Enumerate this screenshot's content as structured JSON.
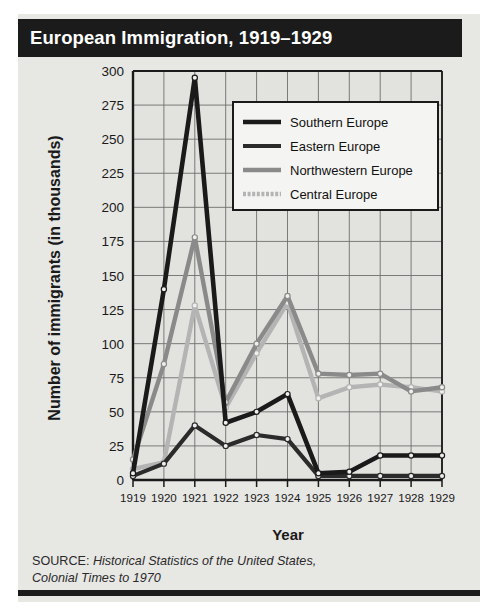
{
  "title": "European Immigration, 1919–1929",
  "axes": {
    "ylabel": "Number of immigrants (in thousands)",
    "xlabel": "Year"
  },
  "source": {
    "label": "SOURCE:",
    "text_line1": "Historical Statistics of the United States,",
    "text_line2": "Colonial Times to 1970"
  },
  "colors": {
    "title_bar": "#1b1b1b",
    "panel_bg": "#e7e7e4",
    "plot_bg": "#e2e2de",
    "grid": "#6e6e6e",
    "axis": "#1a1a1a",
    "southern_europe": "#1a1a1a",
    "eastern_europe": "#2b2b2b",
    "northwestern_europe": "#8a8a8a",
    "central_europe": "#b4b4b4",
    "legend_bg": "#f4f4f2"
  },
  "chart_data": {
    "type": "line",
    "title": "European Immigration, 1919–1929",
    "xlabel": "Year",
    "ylabel": "Number of immigrants (in thousands)",
    "categories": [
      "1919",
      "1920",
      "1921",
      "1922",
      "1923",
      "1924",
      "1925",
      "1926",
      "1927",
      "1928",
      "1929"
    ],
    "x": [
      1919,
      1920,
      1921,
      1922,
      1923,
      1924,
      1925,
      1926,
      1927,
      1928,
      1929
    ],
    "ylim": [
      0,
      300
    ],
    "yticks": [
      0,
      25,
      50,
      75,
      100,
      125,
      150,
      175,
      200,
      225,
      250,
      275,
      300
    ],
    "ytick_labels": [
      "0",
      "25",
      "50",
      "75",
      "100",
      "125",
      "150",
      "175",
      "200",
      "225",
      "250",
      "275",
      "300"
    ],
    "grid": true,
    "legend_position": "upper right",
    "markers": "open-circle",
    "series": [
      {
        "name": "Southern Europe",
        "color": "#1a1a1a",
        "width": 4.6,
        "dash": "none",
        "values": [
          5,
          140,
          295,
          42,
          50,
          63,
          5,
          6,
          18,
          18,
          18
        ]
      },
      {
        "name": "Eastern Europe",
        "color": "#2b2b2b",
        "width": 4.2,
        "dash": "none",
        "values": [
          3,
          12,
          40,
          25,
          33,
          30,
          3,
          3,
          3,
          3,
          3
        ]
      },
      {
        "name": "Northwestern Europe",
        "color": "#8a8a8a",
        "width": 4.4,
        "dash": "none",
        "values": [
          15,
          85,
          178,
          57,
          100,
          135,
          78,
          77,
          78,
          65,
          68
        ]
      },
      {
        "name": "Central Europe",
        "color": "#b4b4b4",
        "width": 4.4,
        "dash": "dotted",
        "values": [
          8,
          13,
          128,
          53,
          93,
          130,
          60,
          68,
          70,
          68,
          65
        ]
      }
    ]
  }
}
